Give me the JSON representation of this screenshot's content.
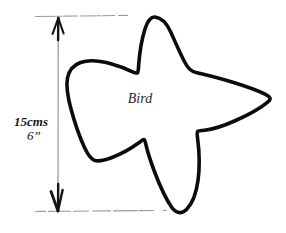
{
  "figure": {
    "background_color": "#ffffff",
    "outline_color": "#000000",
    "dimension_line_color": "#8a8a8a",
    "arrow_color": "#111111"
  },
  "shape": {
    "label": "Bird",
    "label_position": {
      "x": 140,
      "y": 103
    },
    "description": "hand-drawn closed star-like bird outline"
  },
  "dimension": {
    "value_metric": "15cms",
    "value_imperial": "6”",
    "orientation": "vertical",
    "measures": "overall height of bird shape",
    "top_extension_label": "top extension line",
    "bottom_extension_label": "bottom extension line",
    "arrow_top_label": "up arrowhead",
    "arrow_bottom_label": "down arrowhead",
    "text_position": {
      "x": 14,
      "y": 122
    }
  }
}
